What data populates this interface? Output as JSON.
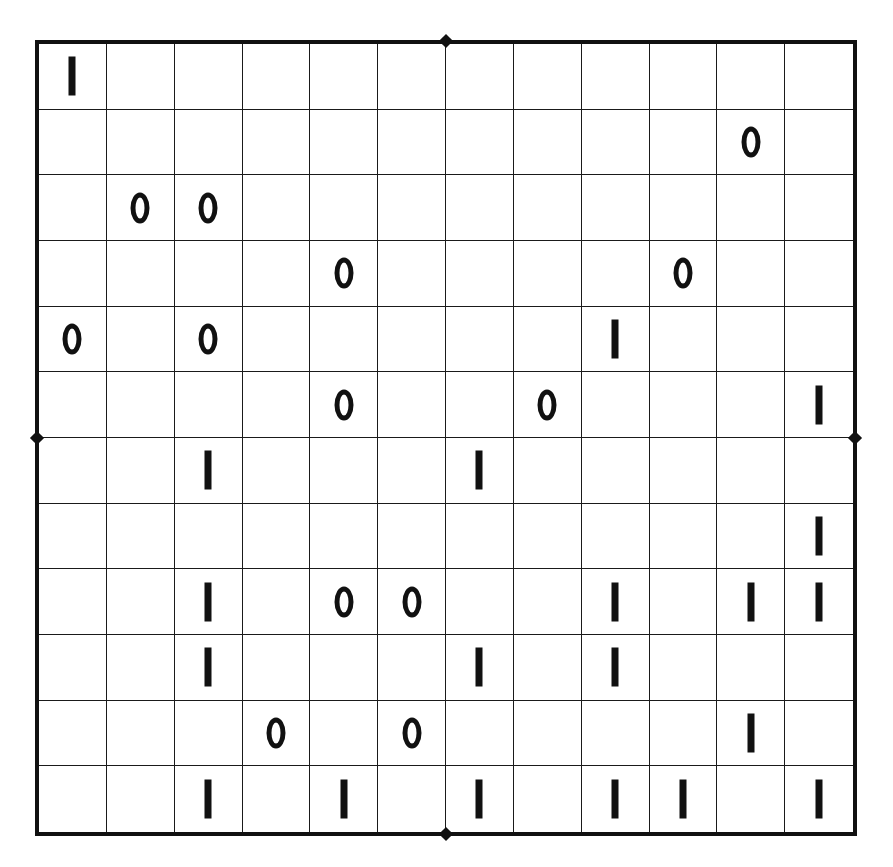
{
  "puzzle": {
    "type": "binary-takuzu",
    "rows": 12,
    "cols": 12,
    "colors": {
      "line": "#1a1a1a",
      "border": "#111111",
      "glyph": "#111111",
      "background": "#ffffff"
    },
    "grid": [
      [
        "1",
        "",
        "",
        "",
        "",
        "",
        "",
        "",
        "",
        "",
        "",
        ""
      ],
      [
        "",
        "",
        "",
        "",
        "",
        "",
        "",
        "",
        "",
        "",
        "0",
        ""
      ],
      [
        "",
        "0",
        "0",
        "",
        "",
        "",
        "",
        "",
        "",
        "",
        "",
        ""
      ],
      [
        "",
        "",
        "",
        "",
        "0",
        "",
        "",
        "",
        "",
        "0",
        "",
        ""
      ],
      [
        "0",
        "",
        "0",
        "",
        "",
        "",
        "",
        "",
        "1",
        "",
        "",
        ""
      ],
      [
        "",
        "",
        "",
        "",
        "0",
        "",
        "",
        "0",
        "",
        "",
        "",
        "1"
      ],
      [
        "",
        "",
        "1",
        "",
        "",
        "",
        "1",
        "",
        "",
        "",
        "",
        ""
      ],
      [
        "",
        "",
        "",
        "",
        "",
        "",
        "",
        "",
        "",
        "",
        "",
        "1"
      ],
      [
        "",
        "",
        "1",
        "",
        "0",
        "0",
        "",
        "",
        "1",
        "",
        "1",
        "1"
      ],
      [
        "",
        "",
        "1",
        "",
        "",
        "",
        "1",
        "",
        "1",
        "",
        "",
        ""
      ],
      [
        "",
        "",
        "",
        "0",
        "",
        "0",
        "",
        "",
        "",
        "",
        "1",
        ""
      ],
      [
        "",
        "",
        "1",
        "",
        "1",
        "",
        "1",
        "",
        "1",
        "1",
        "",
        "1"
      ]
    ],
    "section_markers": [
      "top-center",
      "bottom-center",
      "left-middle",
      "right-middle"
    ]
  }
}
